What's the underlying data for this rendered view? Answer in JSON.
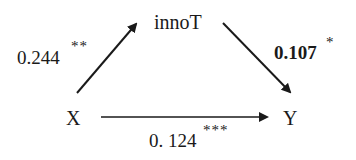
{
  "diagram": {
    "type": "mediation-path-diagram",
    "nodes": {
      "x": "X",
      "mediator": "innoT",
      "y": "Y"
    },
    "paths": {
      "x_to_mediator": {
        "coefficient": "0.244",
        "significance": "**",
        "bold": false
      },
      "mediator_to_y": {
        "coefficient": "0.107",
        "significance": "*",
        "bold": true
      },
      "x_to_y": {
        "coefficient": "0. 124",
        "significance": "***",
        "bold": false
      }
    },
    "colors": {
      "line": "#1a1a1a",
      "text": "#1a1a1a",
      "background": "#ffffff"
    }
  }
}
